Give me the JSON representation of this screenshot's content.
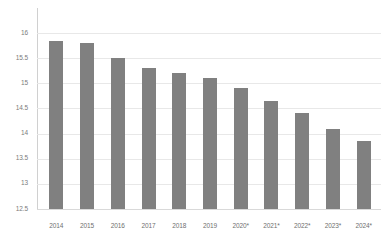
{
  "chart_data": {
    "type": "bar",
    "title": "",
    "subtitle": "",
    "xlabel": "",
    "ylabel": "",
    "categories": [
      "2014",
      "2015",
      "2016",
      "2017",
      "2018",
      "2019",
      "2020*",
      "2021*",
      "2022*",
      "2023*",
      "2024*"
    ],
    "values": [
      15.85,
      15.8,
      15.5,
      15.3,
      15.2,
      15.1,
      14.9,
      14.65,
      14.4,
      14.1,
      13.85
    ],
    "series": [
      {
        "name": "",
        "values": [
          15.85,
          15.8,
          15.5,
          15.3,
          15.2,
          15.1,
          14.9,
          14.65,
          14.4,
          14.1,
          13.85
        ]
      }
    ],
    "ylim": [
      12.5,
      16
    ],
    "ytick_labels": [
      "16",
      "15.5",
      "15",
      "14.5",
      "14",
      "13.5",
      "13",
      "12.5"
    ],
    "ytick_values": [
      16,
      15.5,
      15,
      14.5,
      14,
      13.5,
      13,
      12.5
    ],
    "ystep": 0.5,
    "grid": true,
    "grid_axis": "y",
    "legend": false,
    "legend_position": "none",
    "bar_color": "#808080",
    "grid_color": "#e8e8e8",
    "axis_color": "#d0d0d0",
    "tick_label_color": "#7b7b7b",
    "background_color": "#ffffff",
    "annotations": []
  }
}
